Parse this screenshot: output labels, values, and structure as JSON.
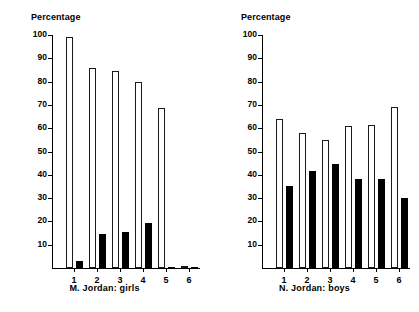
{
  "chart_data": [
    {
      "type": "bar",
      "title": "M. Jordan: girls",
      "ylabel": "Percentage",
      "xlabel": "",
      "ylim": [
        0,
        100
      ],
      "yticks": [
        10,
        20,
        30,
        40,
        50,
        60,
        70,
        80,
        90,
        100
      ],
      "grid": false,
      "legend": "none",
      "categories": [
        "1",
        "2",
        "3",
        "4",
        "5",
        "6"
      ],
      "series": [
        {
          "name": "open",
          "values": [
            99,
            86,
            84.5,
            80,
            68.5,
            1
          ]
        },
        {
          "name": "filled",
          "values": [
            3,
            14.5,
            15.5,
            19.5,
            0.5,
            0.5
          ]
        }
      ]
    },
    {
      "type": "bar",
      "title": "N. Jordan: boys",
      "ylabel": "Percentage",
      "xlabel": "",
      "ylim": [
        0,
        100
      ],
      "yticks": [
        10,
        20,
        30,
        40,
        50,
        60,
        70,
        80,
        90,
        100
      ],
      "grid": false,
      "legend": "none",
      "categories": [
        "1",
        "2",
        "3",
        "4",
        "5",
        "6"
      ],
      "series": [
        {
          "name": "open",
          "values": [
            64,
            58,
            55,
            61,
            61.5,
            69
          ]
        },
        {
          "name": "filled",
          "values": [
            35,
            41.5,
            44.5,
            38,
            38,
            30
          ]
        }
      ]
    }
  ]
}
